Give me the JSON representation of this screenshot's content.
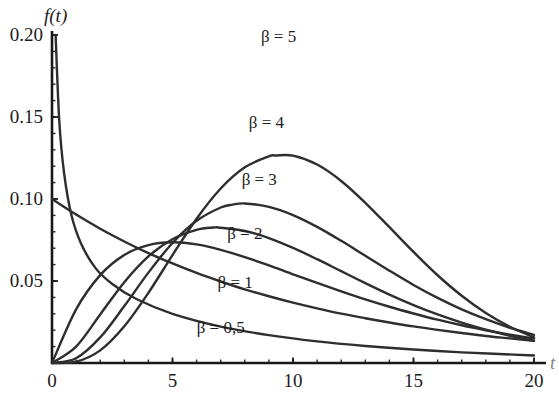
{
  "chart_data": {
    "type": "line",
    "title": "",
    "subtitle": "",
    "xlabel": "t",
    "ylabel": "f(t)",
    "xlim": [
      0,
      20
    ],
    "ylim": [
      0,
      0.2
    ],
    "grid": false,
    "legend_position": "inline-on-curves",
    "x_ticks": [
      "0",
      "5",
      "10",
      "15",
      "20"
    ],
    "x_tick_values": [
      0,
      5,
      10,
      15,
      20
    ],
    "y_ticks": [
      "0.05",
      "0.10",
      "0.15",
      "0.20"
    ],
    "y_tick_values": [
      0.05,
      0.1,
      0.15,
      0.2
    ],
    "x_minor_tick_step": 1,
    "y_minor_tick_step": 0.01,
    "series": [
      {
        "name": "beta = 0,5",
        "label": "β = 0,5",
        "beta": 0.5,
        "peak_x": 0,
        "peak_y": 0.2,
        "values": [
          {
            "x": 0.15,
            "y": 0.2
          },
          {
            "x": 0.3,
            "y": 0.148
          },
          {
            "x": 0.5,
            "y": 0.116
          },
          {
            "x": 0.8,
            "y": 0.0905
          },
          {
            "x": 1.2,
            "y": 0.073
          },
          {
            "x": 1.8,
            "y": 0.058
          },
          {
            "x": 2.5,
            "y": 0.0482
          },
          {
            "x": 3.5,
            "y": 0.039
          },
          {
            "x": 5.0,
            "y": 0.03
          },
          {
            "x": 7.0,
            "y": 0.0222
          },
          {
            "x": 9.0,
            "y": 0.017
          },
          {
            "x": 11.0,
            "y": 0.0132
          },
          {
            "x": 13.0,
            "y": 0.0104
          },
          {
            "x": 15.0,
            "y": 0.0082
          },
          {
            "x": 17.0,
            "y": 0.0065
          },
          {
            "x": 20.0,
            "y": 0.0046
          }
        ]
      },
      {
        "name": "beta = 1",
        "label": "β = 1",
        "beta": 1,
        "peak_x": 0,
        "peak_y": 0.1,
        "values": [
          {
            "x": 0.0,
            "y": 0.1
          },
          {
            "x": 1.0,
            "y": 0.0905
          },
          {
            "x": 2.0,
            "y": 0.0819
          },
          {
            "x": 3.0,
            "y": 0.0741
          },
          {
            "x": 4.0,
            "y": 0.067
          },
          {
            "x": 5.0,
            "y": 0.0607
          },
          {
            "x": 6.0,
            "y": 0.0549
          },
          {
            "x": 7.0,
            "y": 0.0497
          },
          {
            "x": 8.0,
            "y": 0.0449
          },
          {
            "x": 9.0,
            "y": 0.0407
          },
          {
            "x": 10.0,
            "y": 0.0368
          },
          {
            "x": 11.0,
            "y": 0.0333
          },
          {
            "x": 12.0,
            "y": 0.0301
          },
          {
            "x": 13.0,
            "y": 0.0273
          },
          {
            "x": 14.0,
            "y": 0.0247
          },
          {
            "x": 15.0,
            "y": 0.0223
          },
          {
            "x": 16.0,
            "y": 0.0202
          },
          {
            "x": 17.0,
            "y": 0.0183
          },
          {
            "x": 18.0,
            "y": 0.0165
          },
          {
            "x": 19.0,
            "y": 0.015
          },
          {
            "x": 20.0,
            "y": 0.0135
          }
        ]
      },
      {
        "name": "beta = 2",
        "label": "β = 2",
        "beta": 2,
        "peak_x": 5,
        "peak_y": 0.0736,
        "values": [
          {
            "x": 0.0,
            "y": 0.0
          },
          {
            "x": 1.0,
            "y": 0.0327
          },
          {
            "x": 2.0,
            "y": 0.0536
          },
          {
            "x": 3.0,
            "y": 0.0659
          },
          {
            "x": 4.0,
            "y": 0.0719
          },
          {
            "x": 5.0,
            "y": 0.0736
          },
          {
            "x": 6.0,
            "y": 0.0723
          },
          {
            "x": 7.0,
            "y": 0.069
          },
          {
            "x": 8.0,
            "y": 0.0646
          },
          {
            "x": 9.0,
            "y": 0.0595
          },
          {
            "x": 10.0,
            "y": 0.0541
          },
          {
            "x": 11.0,
            "y": 0.0488
          },
          {
            "x": 12.0,
            "y": 0.0437
          },
          {
            "x": 13.0,
            "y": 0.0388
          },
          {
            "x": 14.0,
            "y": 0.0343
          },
          {
            "x": 15.0,
            "y": 0.0302
          },
          {
            "x": 16.0,
            "y": 0.0264
          },
          {
            "x": 17.0,
            "y": 0.023
          },
          {
            "x": 18.0,
            "y": 0.02
          },
          {
            "x": 19.0,
            "y": 0.0173
          },
          {
            "x": 20.0,
            "y": 0.0149
          }
        ]
      },
      {
        "name": "beta = 3",
        "label": "β = 3",
        "beta": 3,
        "peak_x": 6.7,
        "peak_y": 0.112,
        "values": [
          {
            "x": 0.0,
            "y": 0.0
          },
          {
            "x": 1.0,
            "y": 0.01
          },
          {
            "x": 2.0,
            "y": 0.0296
          },
          {
            "x": 3.0,
            "y": 0.0493
          },
          {
            "x": 4.0,
            "y": 0.065
          },
          {
            "x": 5.0,
            "y": 0.0755
          },
          {
            "x": 6.0,
            "y": 0.0812
          },
          {
            "x": 6.7,
            "y": 0.0826
          },
          {
            "x": 7.0,
            "y": 0.0825
          },
          {
            "x": 8.0,
            "y": 0.0805
          },
          {
            "x": 9.0,
            "y": 0.0762
          },
          {
            "x": 10.0,
            "y": 0.0702
          },
          {
            "x": 11.0,
            "y": 0.0633
          },
          {
            "x": 12.0,
            "y": 0.056
          },
          {
            "x": 13.0,
            "y": 0.0487
          },
          {
            "x": 14.0,
            "y": 0.0417
          },
          {
            "x": 15.0,
            "y": 0.0353
          },
          {
            "x": 16.0,
            "y": 0.0296
          },
          {
            "x": 17.0,
            "y": 0.0246
          },
          {
            "x": 18.0,
            "y": 0.0203
          },
          {
            "x": 19.0,
            "y": 0.0166
          },
          {
            "x": 20.0,
            "y": 0.0135
          }
        ]
      },
      {
        "name": "beta = 4",
        "label": "β = 4",
        "beta": 4,
        "peak_x": 7.5,
        "peak_y": 0.152,
        "values": [
          {
            "x": 0.0,
            "y": 0.0
          },
          {
            "x": 1.0,
            "y": 0.0029
          },
          {
            "x": 2.0,
            "y": 0.0156
          },
          {
            "x": 3.0,
            "y": 0.0347
          },
          {
            "x": 4.0,
            "y": 0.0551
          },
          {
            "x": 5.0,
            "y": 0.0732
          },
          {
            "x": 6.0,
            "y": 0.0867
          },
          {
            "x": 7.0,
            "y": 0.0948
          },
          {
            "x": 7.5,
            "y": 0.0966
          },
          {
            "x": 8.0,
            "y": 0.0973
          },
          {
            "x": 9.0,
            "y": 0.0952
          },
          {
            "x": 10.0,
            "y": 0.0902
          },
          {
            "x": 11.0,
            "y": 0.083
          },
          {
            "x": 12.0,
            "y": 0.0745
          },
          {
            "x": 13.0,
            "y": 0.0654
          },
          {
            "x": 14.0,
            "y": 0.0563
          },
          {
            "x": 15.0,
            "y": 0.0476
          },
          {
            "x": 16.0,
            "y": 0.0397
          },
          {
            "x": 17.0,
            "y": 0.0327
          },
          {
            "x": 18.0,
            "y": 0.0267
          },
          {
            "x": 19.0,
            "y": 0.0215
          },
          {
            "x": 20.0,
            "y": 0.0172
          }
        ]
      },
      {
        "name": "beta = 5",
        "label": "β = 5",
        "beta": 5,
        "peak_x": 9.3,
        "peak_y": 0.189,
        "values": [
          {
            "x": 0.0,
            "y": 0.0
          },
          {
            "x": 1.0,
            "y": 0.0008
          },
          {
            "x": 2.0,
            "y": 0.0077
          },
          {
            "x": 3.0,
            "y": 0.0224
          },
          {
            "x": 4.0,
            "y": 0.0428
          },
          {
            "x": 5.0,
            "y": 0.0658
          },
          {
            "x": 6.0,
            "y": 0.088
          },
          {
            "x": 7.0,
            "y": 0.1064
          },
          {
            "x": 8.0,
            "y": 0.1193
          },
          {
            "x": 9.0,
            "y": 0.126
          },
          {
            "x": 9.3,
            "y": 0.1265
          },
          {
            "x": 10.0,
            "y": 0.1264
          },
          {
            "x": 11.0,
            "y": 0.121
          },
          {
            "x": 12.0,
            "y": 0.111
          },
          {
            "x": 13.0,
            "y": 0.0977
          },
          {
            "x": 14.0,
            "y": 0.0828
          },
          {
            "x": 15.0,
            "y": 0.0677
          },
          {
            "x": 16.0,
            "y": 0.0535
          },
          {
            "x": 17.0,
            "y": 0.041
          },
          {
            "x": 18.0,
            "y": 0.0305
          },
          {
            "x": 19.0,
            "y": 0.0221
          },
          {
            "x": 20.0,
            "y": 0.0156
          }
        ]
      }
    ],
    "annotations": [
      {
        "text": "β = 5",
        "x": 9.4,
        "y": 0.196
      },
      {
        "text": "β = 4",
        "x": 8.9,
        "y": 0.1435
      },
      {
        "text": "β = 3",
        "x": 8.6,
        "y": 0.1085
      },
      {
        "text": "β = 2",
        "x": 8.0,
        "y": 0.0755
      },
      {
        "text": "β = 1",
        "x": 7.6,
        "y": 0.0455
      },
      {
        "text": "β = 0,5",
        "x": 7.0,
        "y": 0.0185
      }
    ],
    "colors": {
      "background": "#ffffff",
      "curve": "#2e2e2e",
      "axis": "#181818",
      "text": "#1c1c1c"
    }
  }
}
